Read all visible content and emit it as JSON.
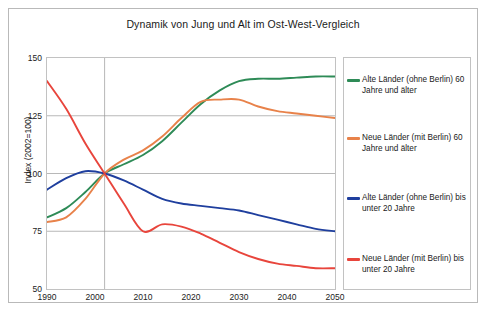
{
  "chart_data": {
    "type": "line",
    "title": "Dynamik von Jung und Alt im Ost-West-Vergleich",
    "xlabel": "",
    "ylabel": "Index (2002=100)",
    "xlim": [
      1990,
      2050
    ],
    "ylim": [
      50,
      150
    ],
    "xticks": [
      1990,
      2000,
      2010,
      2020,
      2030,
      2040,
      2050
    ],
    "yticks": [
      50,
      75,
      100,
      125,
      150
    ],
    "grid": "horizontal gridlines at 75, 100, 125; vertical gridline at 2002",
    "legend_position": "right, outside plot in bordered box",
    "series": [
      {
        "name": "Alte Länder (ohne Berlin) 60 Jahre und älter",
        "color": "#2e8b57",
        "x": [
          1990,
          1994,
          1998,
          2002,
          2006,
          2010,
          2014,
          2018,
          2022,
          2026,
          2030,
          2034,
          2038,
          2042,
          2046,
          2050
        ],
        "values": [
          81,
          85,
          92,
          100,
          104,
          108,
          114,
          122,
          130,
          136,
          140,
          141,
          141,
          141.5,
          142,
          142
        ]
      },
      {
        "name": "Neue Länder (mit Berlin) 60 Jahre und älter",
        "color": "#e8824a",
        "x": [
          1990,
          1994,
          1998,
          2002,
          2006,
          2010,
          2014,
          2018,
          2022,
          2026,
          2030,
          2034,
          2038,
          2042,
          2046,
          2050
        ],
        "values": [
          79,
          81,
          89,
          100,
          106,
          110,
          116,
          124,
          131,
          132,
          132,
          129,
          127,
          126,
          125,
          124
        ]
      },
      {
        "name": "Alte Länder (ohne Berlin) bis unter 20 Jahre",
        "color": "#1f3f9e",
        "x": [
          1990,
          1994,
          1998,
          2002,
          2006,
          2010,
          2014,
          2018,
          2022,
          2026,
          2030,
          2034,
          2038,
          2042,
          2046,
          2050
        ],
        "values": [
          93,
          98,
          101,
          100,
          97,
          93,
          89,
          87,
          86,
          85,
          84,
          82,
          80,
          78,
          76,
          75
        ]
      },
      {
        "name": "Neue Länder (mit Berlin) bis unter 20 Jahre",
        "color": "#e8453c",
        "x": [
          1990,
          1994,
          1998,
          2002,
          2006,
          2010,
          2014,
          2018,
          2022,
          2026,
          2030,
          2034,
          2038,
          2042,
          2046,
          2050
        ],
        "values": [
          140,
          128,
          113,
          100,
          87,
          75,
          78,
          77,
          74,
          70,
          66,
          63,
          61,
          60,
          59,
          59
        ]
      }
    ]
  },
  "legend": {
    "entries": [
      {
        "label": "Alte Länder (ohne Berlin) 60 Jahre und älter",
        "color": "#2e8b57"
      },
      {
        "label": "Neue Länder (mit Berlin) 60 Jahre und älter",
        "color": "#e8824a"
      },
      {
        "label": "Alte Länder (ohne Berlin) bis unter 20 Jahre",
        "color": "#1f3f9e"
      },
      {
        "label": "Neue Länder (mit Berlin) bis unter 20 Jahre",
        "color": "#e8453c"
      }
    ]
  }
}
